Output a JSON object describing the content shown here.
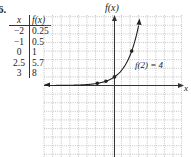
{
  "problem_number": "6.",
  "table": {
    "headers": [
      "x",
      "f(x)"
    ],
    "rows": [
      [
        "−2",
        "0.25"
      ],
      [
        "−1",
        "0.5"
      ],
      [
        "0",
        "1"
      ],
      [
        "2.5",
        "5.7"
      ],
      [
        "3",
        "8"
      ]
    ]
  },
  "graph": {
    "y_axis_label": "f(x)",
    "x_axis_label": "x",
    "annotation": "f(2) = 4",
    "grid": {
      "x_min": -8,
      "x_max": 8,
      "y_min": -8,
      "y_max": 8
    }
  },
  "chart_data": {
    "type": "line",
    "title": "",
    "function": "f(x) = 2^x",
    "xlabel": "x",
    "ylabel": "f(x)",
    "x": [
      -2,
      -1,
      0,
      2
    ],
    "values": [
      0.25,
      0.5,
      1,
      4
    ],
    "plotted_points": [
      [
        -2,
        0.25
      ],
      [
        -1,
        0.5
      ],
      [
        0,
        1
      ],
      [
        2,
        4
      ]
    ],
    "annotation": "f(2) = 4",
    "grid": true,
    "xlim": [
      -8,
      8
    ],
    "ylim": [
      -8,
      8
    ]
  }
}
